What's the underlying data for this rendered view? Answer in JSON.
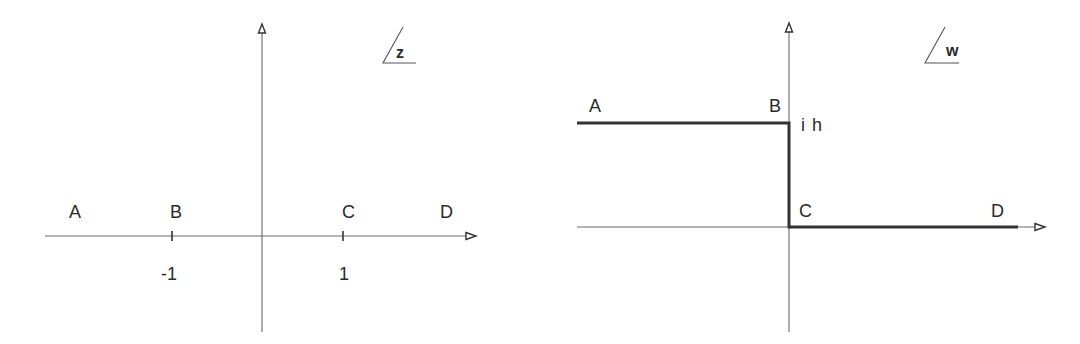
{
  "figure": {
    "left_panel": {
      "plane": "z",
      "points": [
        {
          "name": "A",
          "label": "A"
        },
        {
          "name": "B",
          "label": "B"
        },
        {
          "name": "C",
          "label": "C"
        },
        {
          "name": "D",
          "label": "D"
        }
      ],
      "ticks": [
        {
          "label": "-1"
        },
        {
          "label": "1"
        }
      ]
    },
    "right_panel": {
      "plane": "w",
      "points": [
        {
          "name": "A",
          "label": "A"
        },
        {
          "name": "B",
          "label": "B"
        },
        {
          "name": "C",
          "label": "C"
        },
        {
          "name": "D",
          "label": "D"
        }
      ],
      "height_label": "i h"
    }
  },
  "colors": {
    "ink": "#2a2a2a",
    "axis": "#6a6a6a",
    "background": "#ffffff"
  }
}
